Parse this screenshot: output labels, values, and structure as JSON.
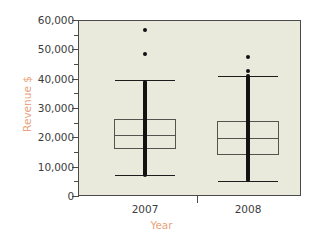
{
  "chart_data": {
    "type": "box",
    "title": "",
    "xlabel": "Year",
    "ylabel": "Revenue $",
    "categories": [
      "2007",
      "2008"
    ],
    "ylim": [
      0,
      60000
    ],
    "ytick_labels": [
      "0",
      "10,000",
      "20,000",
      "30,000",
      "40,000",
      "50,000",
      "60,000"
    ],
    "ytick_values": [
      0,
      10000,
      20000,
      30000,
      40000,
      50000,
      60000
    ],
    "yminor_values": [
      5000,
      15000,
      25000,
      35000,
      45000,
      55000
    ],
    "grid": false,
    "legend": false,
    "plot_background": "#e9e9dc",
    "axis_label_color": "#e8a37e",
    "tick_label_color": "#3c3c3c",
    "marker_color": "#111111",
    "box_edge_color": "#54544f",
    "series": [
      {
        "name": "2007",
        "min_whisker": 7000,
        "q1": 16000,
        "median": 20700,
        "q3": 26400,
        "max_whisker": 39500,
        "outliers": [
          48500,
          56500
        ],
        "overlay": "dense-strip",
        "overlay_range": [
          6500,
          39500
        ]
      },
      {
        "name": "2008",
        "min_whisker": 5000,
        "q1": 14000,
        "median": 19700,
        "q3": 25500,
        "max_whisker": 41000,
        "outliers": [
          42500,
          47500
        ],
        "overlay": "dense-strip",
        "overlay_range": [
          4800,
          41500
        ]
      }
    ]
  }
}
